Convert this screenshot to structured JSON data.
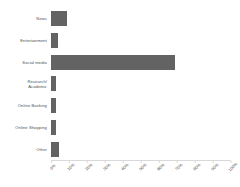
{
  "chart_data": {
    "type": "bar",
    "orientation": "horizontal",
    "title": "",
    "xlabel": "",
    "ylabel": "",
    "categories": [
      "News",
      "Entertainment",
      "Social media",
      "Research/\nAcademic",
      "Online Banking",
      "Online Shopping",
      "Other"
    ],
    "values": [
      9,
      4,
      69,
      3,
      3,
      3,
      4.5
    ],
    "value_suffix": "%",
    "xlim": [
      0,
      100
    ],
    "xticks": [
      0,
      10,
      20,
      30,
      40,
      50,
      60,
      70,
      80,
      90,
      100
    ],
    "xtick_labels": [
      "0%",
      "10%",
      "20%",
      "30%",
      "40%",
      "50%",
      "60%",
      "70%",
      "80%",
      "90%",
      "100%"
    ],
    "grid": false,
    "legend": false,
    "bar_color": "#636363",
    "axis_color": "#d9d9d9",
    "text_color": "#4f4f4f"
  }
}
